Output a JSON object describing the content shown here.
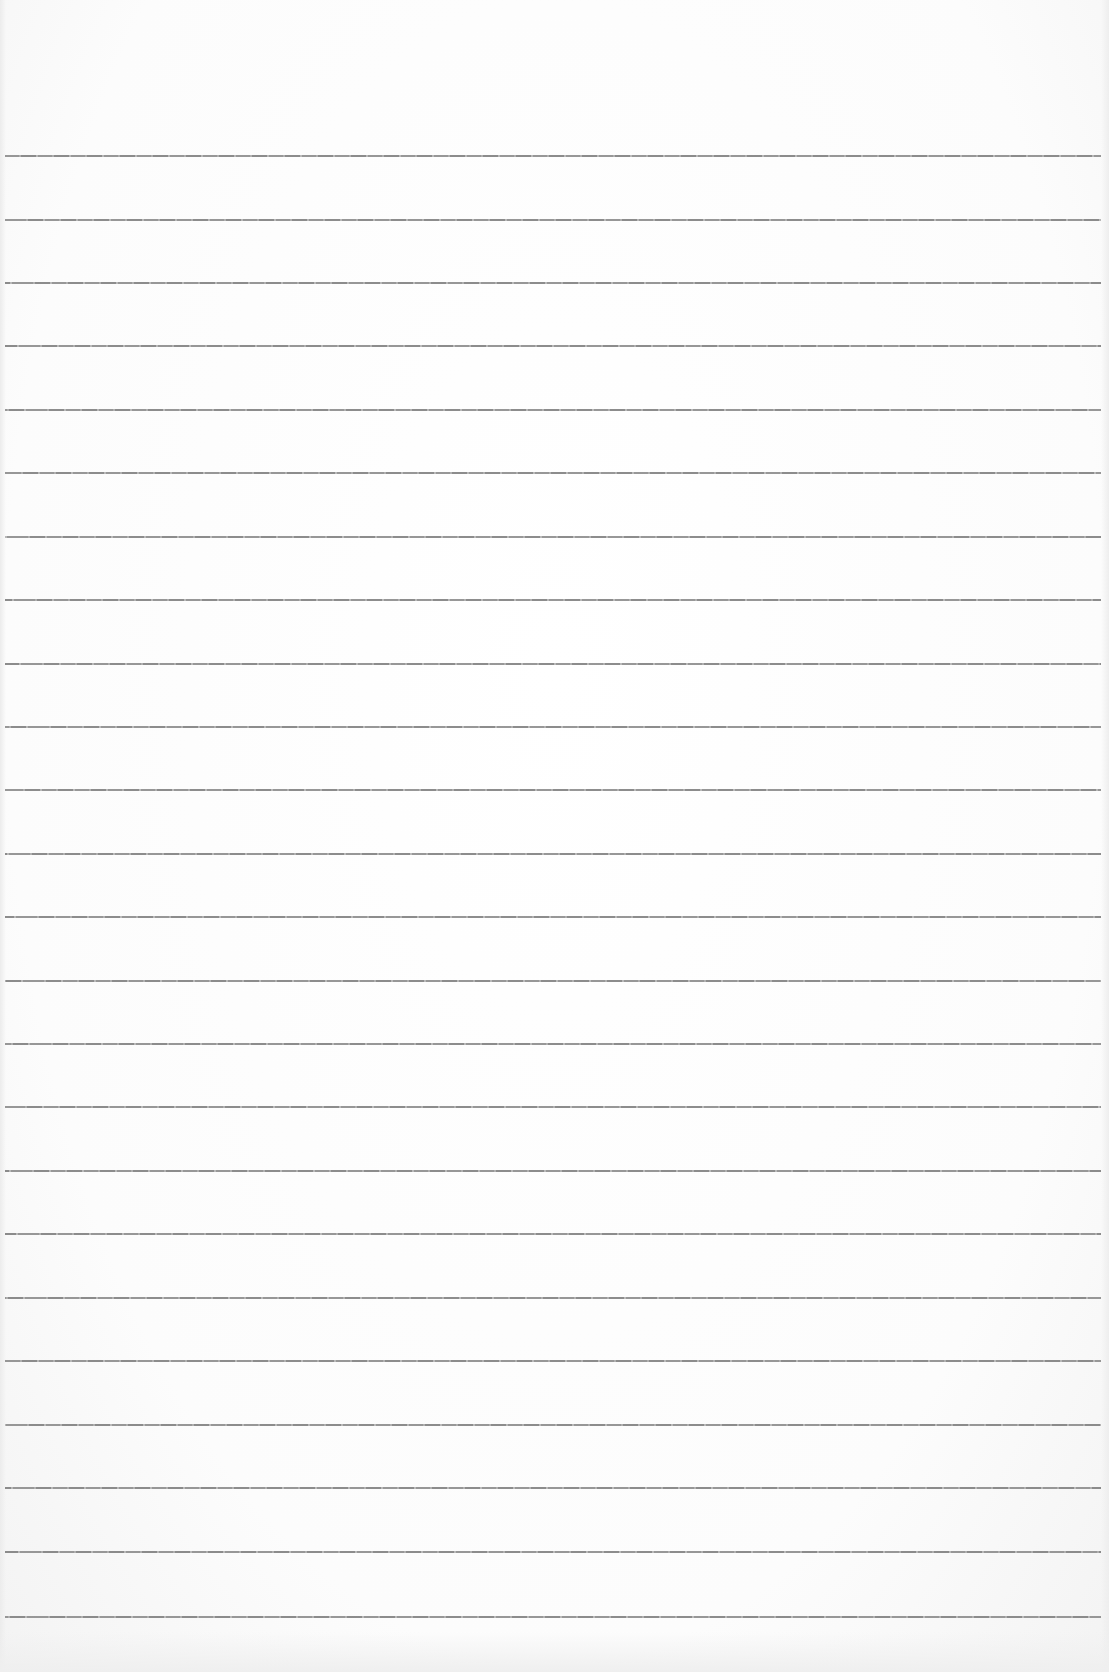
{
  "sheet": {
    "type": "ruled-paper",
    "background_color": "#fdfdfd",
    "rule_color": "#8c8c8c",
    "rule_count": 24,
    "rule_spacing_px": 63.5,
    "margin_line": false
  },
  "rules": [
    {
      "y": 155
    },
    {
      "y": 219
    },
    {
      "y": 282
    },
    {
      "y": 345
    },
    {
      "y": 409
    },
    {
      "y": 472
    },
    {
      "y": 536
    },
    {
      "y": 599
    },
    {
      "y": 663
    },
    {
      "y": 726
    },
    {
      "y": 789
    },
    {
      "y": 853
    },
    {
      "y": 916
    },
    {
      "y": 980
    },
    {
      "y": 1043
    },
    {
      "y": 1106
    },
    {
      "y": 1170
    },
    {
      "y": 1233
    },
    {
      "y": 1297
    },
    {
      "y": 1360
    },
    {
      "y": 1424
    },
    {
      "y": 1487
    },
    {
      "y": 1551
    },
    {
      "y": 1616
    }
  ]
}
